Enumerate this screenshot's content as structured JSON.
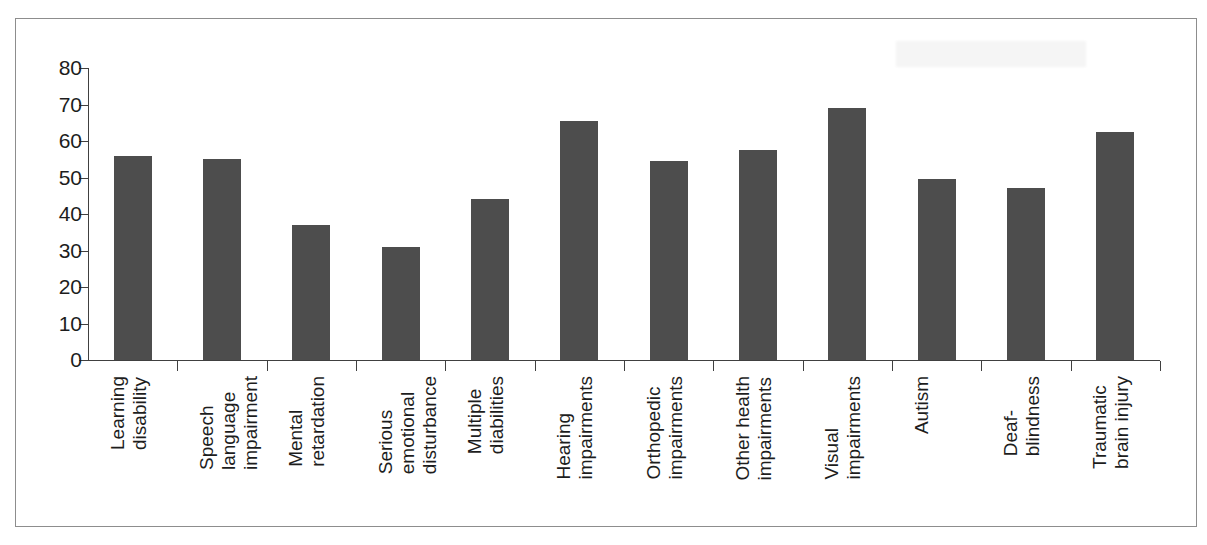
{
  "chart_data": {
    "type": "bar",
    "title": "",
    "subtitle": "",
    "xlabel": "",
    "ylabel": "",
    "ylim": [
      0,
      80
    ],
    "yticks": [
      0,
      10,
      20,
      30,
      40,
      50,
      60,
      70,
      80
    ],
    "ytick_labels": [
      "0",
      "10",
      "20",
      "30",
      "40",
      "50",
      "60",
      "70",
      "80"
    ],
    "grid": false,
    "legend": null,
    "legend_position": "none",
    "bar_color": "#4d4d4d",
    "axis_color": "#404040",
    "categories": [
      "Learning\ndisability",
      "Speech\nlanguage\nimpairment",
      "Mental\nretardation",
      "Serious\nemotional\ndisturbance",
      "Multiple\ndiabilities",
      "Hearing\nimpairments",
      "Orthopedic\nimpairments",
      "Other health\nimpairments",
      "Visual\nimpairments",
      "Autism",
      "Deaf-\nblindness",
      "Traumatic\nbrain injury"
    ],
    "values": [
      56,
      55,
      37,
      31,
      44,
      65.5,
      54.5,
      57.5,
      69,
      49.5,
      47,
      62.5
    ]
  }
}
